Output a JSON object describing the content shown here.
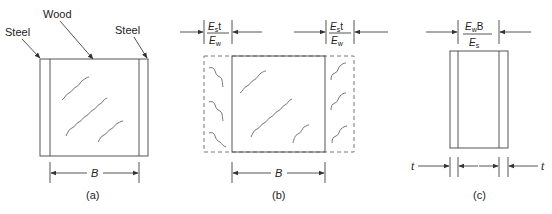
{
  "figure": {
    "panels": [
      {
        "id": "a",
        "caption": "(a)",
        "labels": {
          "left_material": "Steel",
          "center_material": "Wood",
          "right_material": "Steel"
        },
        "dimension": {
          "label": "B"
        }
      },
      {
        "id": "b",
        "caption": "(b)",
        "left_width": {
          "num_main": "E",
          "num_sub": "s",
          "num_tail": "t",
          "den_main": "E",
          "den_sub": "w"
        },
        "right_width": {
          "num_main": "E",
          "num_sub": "s",
          "num_tail": "t",
          "den_main": "E",
          "den_sub": "w"
        },
        "dimension": {
          "label": "B"
        }
      },
      {
        "id": "c",
        "caption": "(c)",
        "top_width": {
          "num_main": "E",
          "num_sub": "w",
          "num_tail": "B",
          "den_main": "E",
          "den_sub": "s"
        },
        "left_thickness": "t",
        "right_thickness": "t"
      }
    ]
  }
}
